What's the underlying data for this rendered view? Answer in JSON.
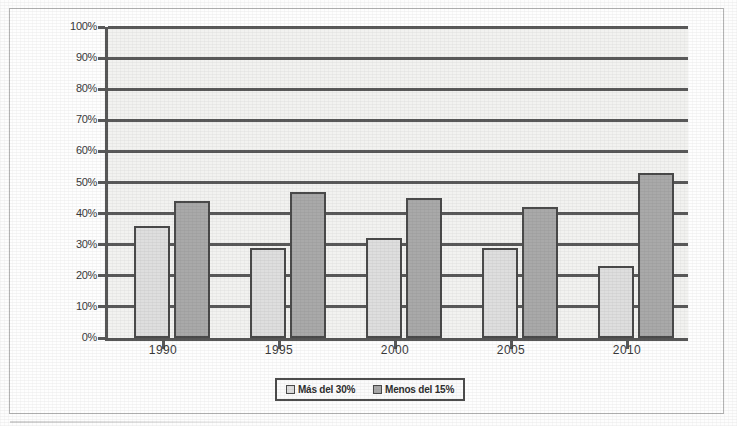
{
  "chart_data": {
    "type": "bar",
    "title": "",
    "subtitle": "",
    "xlabel": "",
    "ylabel": "",
    "categories": [
      "1990",
      "1995",
      "2000",
      "2005",
      "2010"
    ],
    "series": [
      {
        "name": "Más del 30%",
        "color": "#dedede",
        "values": [
          36,
          29,
          32,
          29,
          23
        ]
      },
      {
        "name": "Menos del 15%",
        "color": "#a9a9a9",
        "values": [
          44,
          47,
          45,
          42,
          53
        ]
      }
    ],
    "ylim": [
      0,
      100
    ],
    "ytick_values": [
      0,
      10,
      20,
      30,
      40,
      50,
      60,
      70,
      80,
      90,
      100
    ],
    "ytick_labels": [
      "0%",
      "10%",
      "20%",
      "30%",
      "40%",
      "50%",
      "60%",
      "70%",
      "80%",
      "90%",
      "100%"
    ],
    "grid": true,
    "grid_axis": "y",
    "legend_position": "bottom",
    "plot_background": "#f2f2f0",
    "axis_color": "#575757"
  },
  "legend": {
    "items": [
      {
        "label": "Más del 30%"
      },
      {
        "label": "Menos del 15%"
      }
    ]
  }
}
